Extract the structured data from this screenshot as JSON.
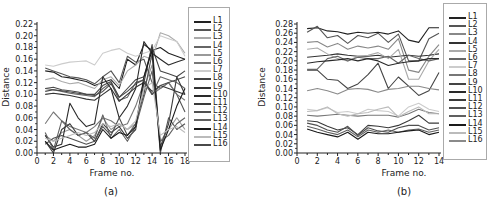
{
  "chart_data": [
    {
      "panel": "(a)",
      "type": "line",
      "title": "",
      "xlabel": "Frame no.",
      "ylabel": "Distance",
      "xlim": [
        0,
        18
      ],
      "ylim": [
        0,
        0.22
      ],
      "xticks": [
        0,
        2,
        4,
        6,
        8,
        10,
        12,
        14,
        16,
        18
      ],
      "yticks": [
        "0.00",
        "0.02",
        "0.04",
        "0.06",
        "0.08",
        "0.10",
        "0.12",
        "0.14",
        "0.16",
        "0.18",
        "0.20",
        "0.22"
      ],
      "grid": false,
      "legend_position": "right",
      "x": [
        1,
        2,
        3,
        4,
        5,
        6,
        7,
        8,
        9,
        10,
        11,
        12,
        13,
        14,
        15,
        16,
        17,
        18
      ],
      "series": [
        {
          "name": "L1",
          "color": "#222222",
          "values": [
            0.14,
            0.138,
            0.13,
            0.128,
            0.125,
            0.122,
            0.115,
            0.12,
            0.125,
            0.11,
            0.16,
            0.15,
            0.185,
            0.175,
            0.18,
            0.17,
            0.165,
            0.16
          ]
        },
        {
          "name": "L2",
          "color": "#555555",
          "values": [
            0.145,
            0.14,
            0.135,
            0.13,
            0.128,
            0.125,
            0.118,
            0.13,
            0.14,
            0.12,
            0.165,
            0.155,
            0.16,
            0.12,
            0.11,
            0.12,
            0.1,
            0.07
          ]
        },
        {
          "name": "L3",
          "color": "#aaaaaa",
          "values": [
            0.125,
            0.128,
            0.122,
            0.118,
            0.12,
            0.115,
            0.11,
            0.125,
            0.13,
            0.115,
            0.14,
            0.15,
            0.165,
            0.16,
            0.205,
            0.2,
            0.19,
            0.17
          ]
        },
        {
          "name": "L4",
          "color": "#666666",
          "values": [
            0.11,
            0.108,
            0.105,
            0.102,
            0.1,
            0.098,
            0.096,
            0.11,
            0.12,
            0.09,
            0.095,
            0.12,
            0.125,
            0.1,
            0.13,
            0.125,
            0.12,
            0.11
          ]
        },
        {
          "name": "L5",
          "color": "#999999",
          "values": [
            0.03,
            0.02,
            0.035,
            0.04,
            0.03,
            0.02,
            0.03,
            0.06,
            0.04,
            0.05,
            0.04,
            0.05,
            0.11,
            0.15,
            0.02,
            0.04,
            0.06,
            0.04
          ]
        },
        {
          "name": "L6",
          "color": "#777777",
          "values": [
            0.05,
            0.07,
            0.055,
            0.045,
            0.04,
            0.035,
            0.045,
            0.06,
            0.055,
            0.045,
            0.05,
            0.08,
            0.12,
            0.1,
            0.11,
            0.12,
            0.1,
            0.09
          ]
        },
        {
          "name": "L7",
          "color": "#cccccc",
          "values": [
            0.15,
            0.148,
            0.152,
            0.155,
            0.156,
            0.157,
            0.15,
            0.17,
            0.175,
            0.178,
            0.17,
            0.165,
            0.17,
            0.175,
            0.2,
            0.195,
            0.19,
            0.165
          ]
        },
        {
          "name": "L8",
          "color": "#444444",
          "values": [
            0.105,
            0.108,
            0.106,
            0.104,
            0.102,
            0.1,
            0.1,
            0.115,
            0.122,
            0.095,
            0.11,
            0.125,
            0.13,
            0.18,
            0.14,
            0.135,
            0.13,
            0.14
          ]
        },
        {
          "name": "L9",
          "color": "#333333",
          "values": [
            0.1,
            0.102,
            0.1,
            0.098,
            0.095,
            0.092,
            0.09,
            0.1,
            0.11,
            0.088,
            0.1,
            0.112,
            0.12,
            0.105,
            0.115,
            0.11,
            0.105,
            0.1
          ]
        },
        {
          "name": "L10",
          "color": "#2a2a2a",
          "values": [
            0.03,
            0.01,
            0.015,
            0.085,
            0.06,
            0.045,
            0.05,
            0.13,
            0.11,
            0.06,
            0.08,
            0.11,
            0.19,
            0.17,
            0.16,
            0.15,
            0.155,
            0.16
          ]
        },
        {
          "name": "L11",
          "color": "#3a3a3a",
          "values": [
            0.02,
            0.0,
            0.04,
            0.05,
            0.03,
            0.035,
            0.02,
            0.05,
            0.035,
            0.045,
            0.025,
            0.04,
            0.12,
            0.185,
            0.01,
            0.05,
            0.13,
            0.1
          ]
        },
        {
          "name": "L12",
          "color": "#505050",
          "values": [
            0.015,
            0.025,
            0.03,
            0.025,
            0.02,
            0.015,
            0.02,
            0.045,
            0.03,
            0.06,
            0.03,
            0.05,
            0.1,
            0.17,
            0.0,
            0.06,
            0.04,
            0.05
          ]
        },
        {
          "name": "L13",
          "color": "#606060",
          "values": [
            0.035,
            0.005,
            0.055,
            0.04,
            0.03,
            0.035,
            0.025,
            0.065,
            0.025,
            0.04,
            0.02,
            0.045,
            0.095,
            0.14,
            0.02,
            0.03,
            0.05,
            0.06
          ]
        },
        {
          "name": "L14",
          "color": "#1a1a1a",
          "values": [
            0.02,
            0.005,
            0.01,
            0.015,
            0.01,
            0.01,
            0.015,
            0.04,
            0.025,
            0.035,
            0.03,
            0.045,
            0.13,
            0.175,
            0.005,
            0.04,
            0.08,
            0.11
          ]
        },
        {
          "name": "L15",
          "color": "#bbbbbb",
          "values": [
            0.025,
            0.02,
            0.025,
            0.03,
            0.035,
            0.03,
            0.035,
            0.05,
            0.045,
            0.05,
            0.04,
            0.055,
            0.11,
            0.12,
            0.03,
            0.04,
            0.045,
            0.035
          ]
        },
        {
          "name": "L16",
          "color": "#4a4a4a",
          "values": [
            0.11,
            0.112,
            0.108,
            0.106,
            0.104,
            0.1,
            0.098,
            0.105,
            0.118,
            0.095,
            0.105,
            0.118,
            0.125,
            0.1,
            0.115,
            0.12,
            0.125,
            0.13
          ]
        }
      ]
    },
    {
      "panel": "(b)",
      "type": "line",
      "title": "",
      "xlabel": "Frame no.",
      "ylabel": "Distance",
      "xlim": [
        0,
        14
      ],
      "ylim": [
        0,
        0.28
      ],
      "xticks": [
        0,
        2,
        4,
        6,
        8,
        10,
        12,
        14
      ],
      "yticks": [
        "0.00",
        "0.02",
        "0.04",
        "0.06",
        "0.08",
        "0.10",
        "0.12",
        "0.14",
        "0.16",
        "0.18",
        "0.20",
        "0.22",
        "0.24",
        "0.26",
        "0.28"
      ],
      "grid": false,
      "legend_position": "right",
      "x": [
        1,
        2,
        3,
        4,
        5,
        6,
        7,
        8,
        9,
        10,
        11,
        12,
        13,
        14
      ],
      "series": [
        {
          "name": "L1",
          "color": "#222222",
          "values": [
            0.27,
            0.272,
            0.265,
            0.263,
            0.258,
            0.262,
            0.26,
            0.262,
            0.258,
            0.265,
            0.245,
            0.24,
            0.272,
            0.272
          ]
        },
        {
          "name": "L2",
          "color": "#555555",
          "values": [
            0.262,
            0.275,
            0.25,
            0.255,
            0.238,
            0.255,
            0.25,
            0.26,
            0.24,
            0.258,
            0.2,
            0.2,
            0.248,
            0.26
          ]
        },
        {
          "name": "L3",
          "color": "#888888",
          "values": [
            0.24,
            0.242,
            0.23,
            0.238,
            0.225,
            0.232,
            0.228,
            0.232,
            0.225,
            0.248,
            0.18,
            0.175,
            0.21,
            0.235
          ]
        },
        {
          "name": "L4",
          "color": "#333333",
          "values": [
            0.208,
            0.21,
            0.212,
            0.215,
            0.212,
            0.21,
            0.21,
            0.212,
            0.208,
            0.21,
            0.212,
            0.21,
            0.212,
            0.215
          ]
        },
        {
          "name": "L5",
          "color": "#aaaaaa",
          "values": [
            0.225,
            0.228,
            0.215,
            0.205,
            0.2,
            0.21,
            0.212,
            0.218,
            0.205,
            0.225,
            0.16,
            0.16,
            0.2,
            0.225
          ]
        },
        {
          "name": "L6",
          "color": "#666666",
          "values": [
            0.182,
            0.182,
            0.205,
            0.21,
            0.2,
            0.208,
            0.205,
            0.205,
            0.21,
            0.195,
            0.212,
            0.205,
            0.2,
            0.205
          ]
        },
        {
          "name": "L7",
          "color": "#cccccc",
          "values": [
            0.095,
            0.092,
            0.098,
            0.088,
            0.09,
            0.085,
            0.095,
            0.092,
            0.09,
            0.08,
            0.1,
            0.108,
            0.095,
            0.09
          ]
        },
        {
          "name": "L8",
          "color": "#777777",
          "values": [
            0.082,
            0.08,
            0.082,
            0.084,
            0.082,
            0.08,
            0.082,
            0.082,
            0.082,
            0.078,
            0.085,
            0.095,
            0.088,
            0.085
          ]
        },
        {
          "name": "L9",
          "color": "#444444",
          "values": [
            0.18,
            0.18,
            0.16,
            0.158,
            0.14,
            0.15,
            0.17,
            0.195,
            0.14,
            0.165,
            0.145,
            0.125,
            0.135,
            0.175
          ]
        },
        {
          "name": "L10",
          "color": "#2a2a2a",
          "values": [
            0.195,
            0.198,
            0.2,
            0.202,
            0.205,
            0.2,
            0.205,
            0.2,
            0.19,
            0.195,
            0.198,
            0.2,
            0.205,
            0.205
          ]
        },
        {
          "name": "L11",
          "color": "#3a3a3a",
          "values": [
            0.07,
            0.068,
            0.058,
            0.05,
            0.055,
            0.04,
            0.06,
            0.058,
            0.055,
            0.06,
            0.07,
            0.082,
            0.065,
            0.065
          ]
        },
        {
          "name": "L12",
          "color": "#505050",
          "values": [
            0.065,
            0.06,
            0.05,
            0.045,
            0.058,
            0.038,
            0.055,
            0.048,
            0.045,
            0.055,
            0.06,
            0.06,
            0.05,
            0.055
          ]
        },
        {
          "name": "L13",
          "color": "#606060",
          "values": [
            0.058,
            0.052,
            0.045,
            0.04,
            0.05,
            0.035,
            0.05,
            0.045,
            0.05,
            0.045,
            0.05,
            0.052,
            0.045,
            0.05
          ]
        },
        {
          "name": "L14",
          "color": "#1a1a1a",
          "values": [
            0.052,
            0.045,
            0.04,
            0.035,
            0.045,
            0.03,
            0.045,
            0.042,
            0.042,
            0.045,
            0.048,
            0.05,
            0.04,
            0.045
          ]
        },
        {
          "name": "L15",
          "color": "#bbbbbb",
          "values": [
            0.09,
            0.092,
            0.1,
            0.085,
            0.08,
            0.085,
            0.088,
            0.095,
            0.1,
            0.078,
            0.09,
            0.1,
            0.085,
            0.085
          ]
        },
        {
          "name": "L16",
          "color": "#8a8a8a",
          "values": [
            0.135,
            0.14,
            0.135,
            0.128,
            0.138,
            0.14,
            0.138,
            0.132,
            0.138,
            0.14,
            0.145,
            0.145,
            0.14,
            0.137
          ]
        }
      ]
    }
  ],
  "captions": [
    "(a)",
    "(b)"
  ],
  "axis_labels": {
    "x": "Frame no.",
    "y": "Distance"
  }
}
